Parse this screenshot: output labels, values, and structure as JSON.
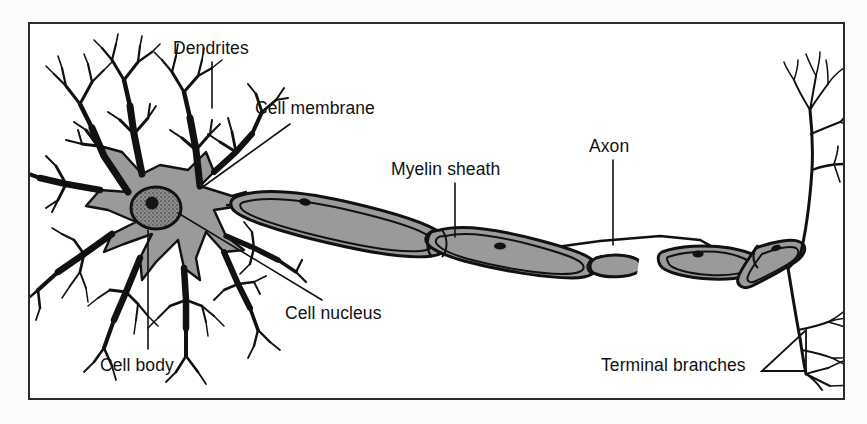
{
  "figure": {
    "background_color": "#fbfbf9",
    "frame_color": "#2b2b2b",
    "ink_color": "#111111",
    "cell_fill_color": "#9a9a9a",
    "nucleus_fill_color": "#8d8d8d"
  },
  "labels": {
    "dendrites": "Dendrites",
    "cell_membrane": "Cell membrane",
    "myelin_sheath": "Myelin sheath",
    "axon": "Axon",
    "cell_nucleus": "Cell nucleus",
    "cell_body": "Cell body",
    "terminal_branches": "Terminal branches"
  },
  "parts": [
    {
      "id": "dendrites",
      "name": "Dendrites"
    },
    {
      "id": "cell-membrane",
      "name": "Cell membrane"
    },
    {
      "id": "cell-body",
      "name": "Cell body"
    },
    {
      "id": "cell-nucleus",
      "name": "Cell nucleus"
    },
    {
      "id": "myelin-sheath",
      "name": "Myelin sheath"
    },
    {
      "id": "axon",
      "name": "Axon"
    },
    {
      "id": "terminal-branches",
      "name": "Terminal branches"
    }
  ]
}
